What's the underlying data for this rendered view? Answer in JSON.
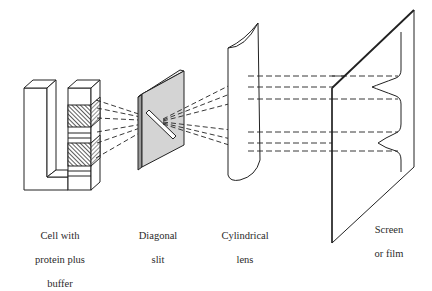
{
  "diagram": {
    "type": "schlieren optical setup",
    "components": [
      {
        "id": "cell",
        "label_lines": [
          "Cell with",
          "protein plus",
          "buffer"
        ]
      },
      {
        "id": "slit",
        "label_lines": [
          "Diagonal",
          "slit"
        ]
      },
      {
        "id": "lens",
        "label_lines": [
          "Cylindrical",
          "lens"
        ]
      },
      {
        "id": "screen",
        "label_lines": [
          "Screen",
          "or film"
        ]
      }
    ],
    "colors": {
      "line": "#222222",
      "slit_fill": "#d4d4d4",
      "hatch": "#333333",
      "background": "#ffffff"
    }
  }
}
